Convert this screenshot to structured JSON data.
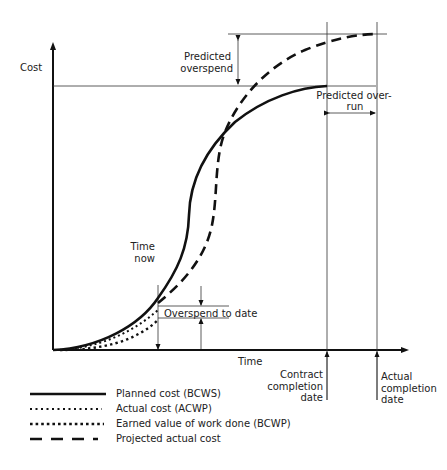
{
  "diagram": {
    "axes": {
      "y_label": "Cost",
      "x_label": "Time"
    },
    "annotations": {
      "predicted_overspend": [
        "Predicted",
        "overspend"
      ],
      "predicted_overrun": [
        "Predicted over-",
        "run"
      ],
      "time_now": [
        "Time",
        "now"
      ],
      "overspend_to_date": "Overspend to date",
      "contract_completion": [
        "Contract",
        "completion",
        "date"
      ],
      "actual_completion": [
        "Actual",
        "completion",
        "date"
      ]
    },
    "legend": [
      {
        "style": "solid",
        "label": "Planned cost (BCWS)"
      },
      {
        "style": "dotted",
        "label": "Actual cost (ACWP)"
      },
      {
        "style": "dotted-heavy",
        "label": "Earned value of work done (BCWP)"
      },
      {
        "style": "dashed",
        "label": "Projected actual cost"
      }
    ],
    "colors": {
      "line": "#111111",
      "text": "#222222",
      "background": "#ffffff"
    }
  }
}
